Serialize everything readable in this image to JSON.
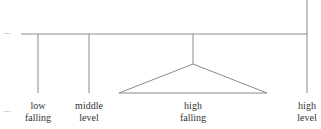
{
  "diagram": {
    "type": "tone-tree",
    "line_color": "#8a8a8a",
    "text_color": "#333333",
    "ellipsis_top": "...",
    "ellipsis_bottom": "...",
    "nodes": [
      {
        "id": "low-falling",
        "line1": "low",
        "line2": "falling"
      },
      {
        "id": "middle-level",
        "line1": "middle",
        "line2": "level"
      },
      {
        "id": "high-falling",
        "line1": "high",
        "line2": "falling",
        "shape": "triangle"
      },
      {
        "id": "high-level",
        "line1": "high",
        "line2": "level"
      }
    ]
  }
}
